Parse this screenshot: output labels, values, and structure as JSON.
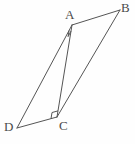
{
  "figure": {
    "background_color": "#fefefe",
    "stroke_color": "#555555",
    "label_color": "#4a4a4a",
    "width": 135,
    "height": 144
  },
  "vertices": {
    "A": {
      "label": "A",
      "x": 72,
      "y": 25,
      "label_x": 65,
      "label_y": 8
    },
    "B": {
      "label": "B",
      "x": 120,
      "y": 10,
      "label_x": 121,
      "label_y": 1
    },
    "C": {
      "label": "C",
      "x": 57,
      "y": 117,
      "label_x": 59,
      "label_y": 119
    },
    "D": {
      "label": "D",
      "x": 17,
      "y": 128,
      "label_x": 4,
      "label_y": 120
    }
  },
  "segments": [
    {
      "name": "side-AB",
      "from": "A",
      "to": "B"
    },
    {
      "name": "side-BC",
      "from": "B",
      "to": "C"
    },
    {
      "name": "side-CD",
      "from": "C",
      "to": "D"
    },
    {
      "name": "side-DA",
      "from": "D",
      "to": "A"
    },
    {
      "name": "diagonal-AC",
      "from": "A",
      "to": "C"
    }
  ],
  "angle_marks": [
    {
      "name": "right-angle-at-A",
      "vertex": "A",
      "type": "right-angle-square"
    },
    {
      "name": "right-angle-at-C",
      "vertex": "C",
      "type": "right-angle-square"
    }
  ]
}
